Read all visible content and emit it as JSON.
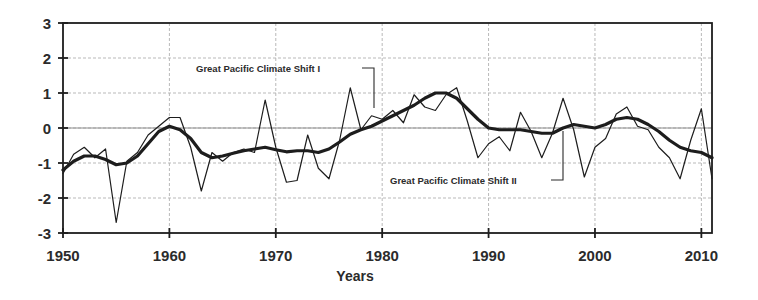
{
  "chart_data": {
    "type": "line",
    "title": "",
    "xlabel": "Years",
    "ylabel": "",
    "xlim": [
      1950,
      2011
    ],
    "ylim": [
      -3,
      3
    ],
    "grid": true,
    "legend": "none",
    "xticks": [
      "1950",
      "1960",
      "1970",
      "1980",
      "1990",
      "2000",
      "2010"
    ],
    "xtick_values": [
      1950,
      1960,
      1970,
      1980,
      1990,
      2000,
      2010
    ],
    "yticks": [
      "3",
      "2",
      "1",
      "0",
      "-1",
      "-2",
      "-3"
    ],
    "ytick_values": [
      3,
      2,
      1,
      0,
      -1,
      -2,
      -3
    ],
    "x": [
      1950,
      1951,
      1952,
      1953,
      1954,
      1955,
      1956,
      1957,
      1958,
      1959,
      1960,
      1961,
      1962,
      1963,
      1964,
      1965,
      1966,
      1967,
      1968,
      1969,
      1970,
      1971,
      1972,
      1973,
      1974,
      1975,
      1976,
      1977,
      1978,
      1979,
      1980,
      1981,
      1982,
      1983,
      1984,
      1985,
      1986,
      1987,
      1988,
      1989,
      1990,
      1991,
      1992,
      1993,
      1994,
      1995,
      1996,
      1997,
      1998,
      1999,
      2000,
      2001,
      2002,
      2003,
      2004,
      2005,
      2006,
      2007,
      2008,
      2009,
      2010,
      2011
    ],
    "series": [
      {
        "name": "Annual index",
        "style": "thin",
        "values": [
          -1.3,
          -0.75,
          -0.55,
          -0.85,
          -0.6,
          -2.7,
          -0.95,
          -0.7,
          -0.2,
          0.05,
          0.3,
          0.3,
          -0.55,
          -1.8,
          -0.7,
          -0.95,
          -0.7,
          -0.6,
          -0.7,
          0.8,
          -0.55,
          -1.55,
          -1.5,
          -0.2,
          -1.15,
          -1.45,
          -0.35,
          1.15,
          -0.05,
          0.35,
          0.25,
          0.5,
          0.15,
          0.95,
          0.6,
          0.5,
          0.95,
          1.15,
          0.2,
          -0.85,
          -0.45,
          -0.25,
          -0.65,
          0.45,
          -0.1,
          -0.85,
          -0.15,
          0.85,
          -0.05,
          -1.4,
          -0.55,
          -0.3,
          0.4,
          0.6,
          0.05,
          -0.05,
          -0.55,
          -0.85,
          -1.45,
          -0.35,
          0.55,
          -1.45
        ]
      },
      {
        "name": "Smoothed index",
        "style": "thick",
        "values": [
          -1.2,
          -0.95,
          -0.8,
          -0.8,
          -0.9,
          -1.05,
          -1.0,
          -0.8,
          -0.45,
          -0.1,
          0.05,
          -0.05,
          -0.3,
          -0.7,
          -0.85,
          -0.8,
          -0.72,
          -0.65,
          -0.6,
          -0.55,
          -0.62,
          -0.68,
          -0.65,
          -0.65,
          -0.7,
          -0.6,
          -0.4,
          -0.18,
          -0.05,
          0.05,
          0.2,
          0.35,
          0.5,
          0.65,
          0.85,
          1.0,
          1.0,
          0.85,
          0.55,
          0.25,
          0.0,
          -0.05,
          -0.05,
          -0.05,
          -0.1,
          -0.15,
          -0.15,
          0.0,
          0.1,
          0.05,
          0.0,
          0.1,
          0.25,
          0.3,
          0.25,
          0.1,
          -0.1,
          -0.35,
          -0.55,
          -0.65,
          -0.7,
          -0.85
        ]
      }
    ],
    "annotations": [
      {
        "name": "shift-1",
        "text": "Great Pacific Climate Shift I",
        "text_x": 196,
        "text_y": 72,
        "leader": "M 362 68 L 374 68 L 374 108"
      },
      {
        "name": "shift-2",
        "text": "Great Pacific Climate Shift II",
        "text_x": 390,
        "text_y": 184,
        "leader": "M 551 180 L 563 180 L 563 131"
      }
    ]
  },
  "colors": {
    "line": "#1d1d1d",
    "axis": "#1d1d1d",
    "grid": "#b9b9b9",
    "background": "#ffffff"
  }
}
